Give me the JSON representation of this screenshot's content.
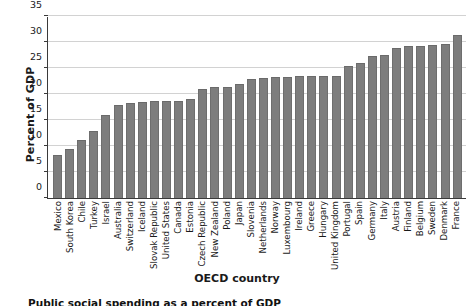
{
  "chart_data": {
    "type": "bar",
    "title": "",
    "xlabel": "OECD country",
    "ylabel": "Percent of GDP",
    "ylim": [
      0,
      35
    ],
    "yticks": [
      0,
      5,
      10,
      15,
      20,
      25,
      30,
      35
    ],
    "grid": true,
    "legend": null,
    "bar_color": "#7d7d7d",
    "categories": [
      "Mexico",
      "South Korea",
      "Chile",
      "Turkey",
      "Israel",
      "Australia",
      "Switzerland",
      "Iceland",
      "Slovak Republic",
      "United States",
      "Canada",
      "Estonia",
      "Czech Republic",
      "New Zealand",
      "Poland",
      "Japan",
      "Slovenia",
      "Netherlands",
      "Norway",
      "Luxembourg",
      "Ireland",
      "Greece",
      "Hungary",
      "United Kingdom",
      "Portugal",
      "Spain",
      "Germany",
      "Italy",
      "Austria",
      "Finland",
      "Belgium",
      "Sweden",
      "Denmark",
      "France"
    ],
    "values": [
      8.2,
      9.4,
      11.2,
      12.8,
      15.9,
      17.9,
      18.2,
      18.5,
      18.6,
      18.7,
      18.7,
      19.0,
      21.0,
      21.3,
      21.4,
      22.0,
      22.8,
      23.0,
      23.2,
      23.3,
      23.4,
      23.4,
      23.4,
      23.4,
      25.4,
      26.0,
      27.3,
      27.5,
      28.9,
      29.3,
      29.3,
      29.4,
      29.6,
      31.3
    ]
  },
  "axis": {
    "y_title": "Percent of GDP",
    "x_title": "OECD country",
    "y_tick_labels": [
      "0",
      "5",
      "10",
      "15",
      "20",
      "25",
      "30",
      "35"
    ]
  },
  "caption": {
    "text": "Public social spending as a percent of GDP"
  }
}
